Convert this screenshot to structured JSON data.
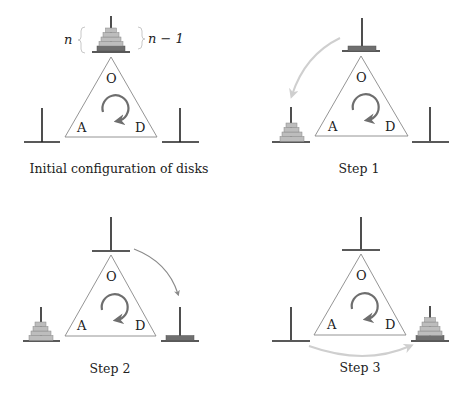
{
  "diagram": {
    "peg_labels": {
      "origin": "O",
      "auxiliary": "A",
      "destination": "D"
    },
    "brace_left_label": "n",
    "brace_right_label": "n − 1",
    "colors": {
      "peg": "#222222",
      "triangle": "#888888",
      "rotation_arrow": "#6e6e6e",
      "disk_light": "#bdbdbd",
      "disk_dark": "#6f6f6f",
      "move_arrow_light": "#cfcfcf",
      "move_arrow_dark": "#8a8a8a"
    },
    "panels": [
      {
        "caption": "Initial configuration of disks",
        "disks_on": {
          "O": "n",
          "A": "0",
          "D": "0"
        },
        "move": "none"
      },
      {
        "caption": "Step 1",
        "disks_on": {
          "O": "1",
          "A": "n-1",
          "D": "0"
        },
        "move": "O → A (n−1 disks)"
      },
      {
        "caption": "Step 2",
        "disks_on": {
          "O": "0",
          "A": "n-1",
          "D": "1"
        },
        "move": "O → D (largest disk)"
      },
      {
        "caption": "Step 3",
        "disks_on": {
          "O": "0",
          "A": "0",
          "D": "n"
        },
        "move": "A → D (n−1 disks)"
      }
    ]
  }
}
